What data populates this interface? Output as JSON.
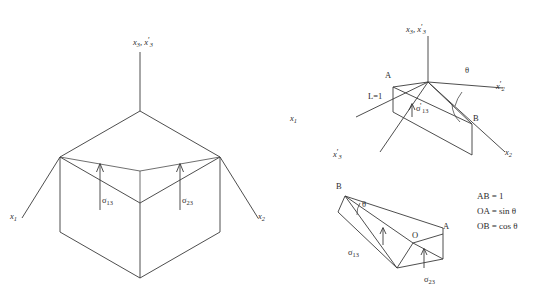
{
  "figure": {
    "background_color": "#ffffff",
    "line_color": "#3a3a3a",
    "text_color": "#2b2b2b"
  },
  "cube_diagram": {
    "name": "stress-cube-diagram",
    "axis_labels": {
      "vertical": "x3, x'3",
      "vertical_parts": {
        "base": "x",
        "sub": "3",
        "base2": "x",
        "sub2": "3",
        "prime2": "'"
      },
      "left": "x1",
      "left_base": "x",
      "left_sub": "1",
      "right": "x2",
      "right_base": "x",
      "right_sub": "2"
    },
    "stress_labels": [
      {
        "symbol": "σ",
        "sub": "13",
        "full": "σ13"
      },
      {
        "symbol": "σ",
        "sub": "23",
        "full": "σ23"
      }
    ]
  },
  "tetra_diagram": {
    "name": "tetrahedron-diagram",
    "axis_labels": {
      "vertical": "x3, x'3",
      "x1": "x1",
      "x1_base": "x",
      "x1_sub": "1",
      "x3p": "x'3",
      "x3p_base": "x",
      "x3p_sub": "3",
      "x2p": "x'2",
      "x2p_base": "x",
      "x2p_sub": "2",
      "x2": "x2",
      "x2_base": "x",
      "x2_sub": "2"
    },
    "point_labels": [
      {
        "id": "A",
        "text": "A"
      },
      {
        "id": "B",
        "text": "B"
      }
    ],
    "angle_label": "θ",
    "length_label": "L=1",
    "stress_label": {
      "symbol": "σ",
      "prime": "'",
      "sub": "13",
      "full": "σ'13"
    }
  },
  "wedge_diagram": {
    "name": "wedge-diagram",
    "point_labels": [
      {
        "id": "B",
        "text": "B"
      },
      {
        "id": "O",
        "text": "O"
      },
      {
        "id": "A",
        "text": "A"
      }
    ],
    "angle_label": "θ",
    "stress_labels": [
      {
        "symbol": "σ",
        "sub": "13",
        "full": "σ13"
      },
      {
        "symbol": "σ",
        "sub": "23",
        "full": "σ23"
      }
    ]
  },
  "equations": {
    "name": "equation-block",
    "lines": [
      "AB = 1",
      "OA = sin θ",
      "OB = cos θ"
    ]
  }
}
